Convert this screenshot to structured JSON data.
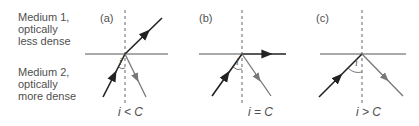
{
  "figure": {
    "medium1": {
      "lines": [
        "Medium 1,",
        "optically",
        "less dense"
      ]
    },
    "medium2": {
      "lines": [
        "Medium 2,",
        "optically",
        "more dense"
      ]
    },
    "panels": [
      {
        "tag": "(a)",
        "condition": "i < C",
        "angle_label": "i",
        "case": "refraction",
        "refracted_ray": "emerges into medium 1",
        "reflected_ray": "weak partial reflection"
      },
      {
        "tag": "(b)",
        "condition": "i = C",
        "angle_label": "i",
        "case": "critical angle",
        "refracted_ray": "travels along boundary",
        "reflected_ray": "partial reflection"
      },
      {
        "tag": "(c)",
        "condition": "i > C",
        "angle_label": "i",
        "case": "total internal reflection",
        "refracted_ray": "none",
        "reflected_ray": "total internal reflection"
      }
    ],
    "colors": {
      "ray": "#222222",
      "reflected_ray": "#777777",
      "boundary": "#555555",
      "normal": "#666666",
      "text": "#4f4f4f"
    }
  }
}
